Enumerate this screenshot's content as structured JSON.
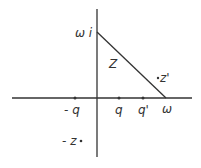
{
  "diagram": {
    "type": "complex-plane",
    "colors": {
      "line": "#333333",
      "background": "#ffffff"
    },
    "axes": {
      "real": {
        "x1": 12,
        "y": 98,
        "x2": 192
      },
      "imag": {
        "x": 97,
        "y1": 9,
        "y2": 157
      }
    },
    "triangle_edge": {
      "from": "ωi",
      "to": "ω"
    },
    "labels": {
      "omega_i": "ω i",
      "omega": "ω",
      "region_z": "Z",
      "z_prime": "z'",
      "neg_q": "- q",
      "q": "q",
      "q_prime": "q'",
      "neg_z": "- z"
    },
    "points": [
      {
        "name": "neg-q",
        "label": "- q",
        "x": 75,
        "y": 98
      },
      {
        "name": "q",
        "label": "q",
        "x": 119,
        "y": 98
      },
      {
        "name": "q-prime",
        "label": "q'",
        "x": 143,
        "y": 98
      },
      {
        "name": "z-prime",
        "label": "z'",
        "x": 158,
        "y": 78
      },
      {
        "name": "neg-z",
        "label": "- z",
        "x": 80,
        "y": 141
      }
    ]
  }
}
